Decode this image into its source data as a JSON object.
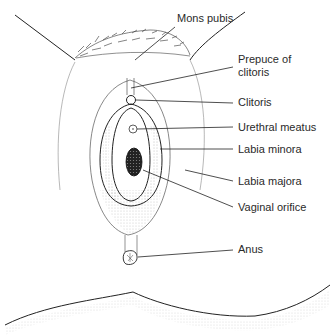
{
  "diagram": {
    "labels": [
      {
        "id": "mons-pubis",
        "text": "Mons pubis",
        "x": 177,
        "y": 17
      },
      {
        "id": "prepuce-of-clitoris-1",
        "text": "Prepuce of",
        "x": 238,
        "y": 54
      },
      {
        "id": "prepuce-of-clitoris-2",
        "text": "clitoris",
        "x": 238,
        "y": 67
      },
      {
        "id": "clitoris",
        "text": "Clitoris",
        "x": 238,
        "y": 96
      },
      {
        "id": "urethral-meatus",
        "text": "Urethral meatus",
        "x": 238,
        "y": 121
      },
      {
        "id": "labia-minora",
        "text": "Labia minora",
        "x": 238,
        "y": 143
      },
      {
        "id": "labia-majora",
        "text": "Labia majora",
        "x": 238,
        "y": 175
      },
      {
        "id": "vaginal-orifice",
        "text": "Vaginal orifice",
        "x": 238,
        "y": 201
      },
      {
        "id": "anus",
        "text": "Anus",
        "x": 238,
        "y": 243
      }
    ]
  }
}
